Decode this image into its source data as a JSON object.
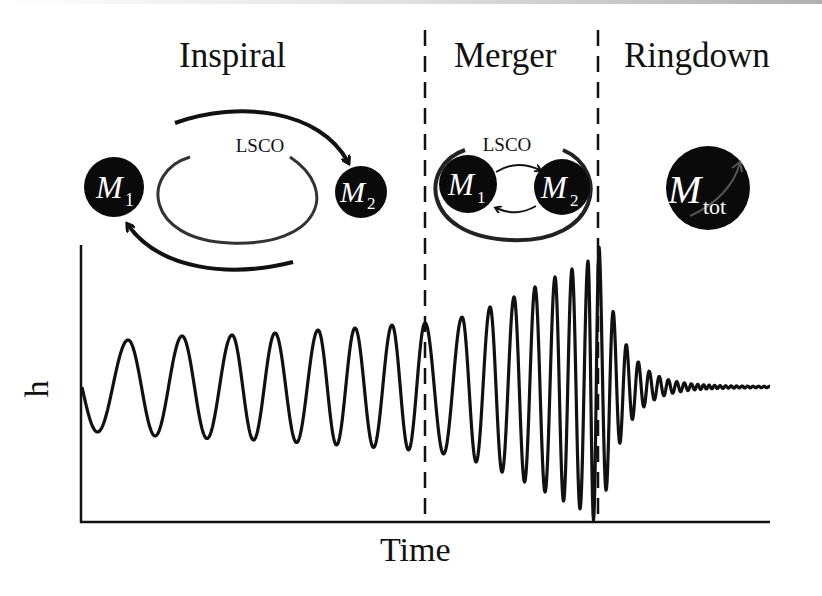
{
  "phases": [
    {
      "label": "Inspiral"
    },
    {
      "label": "Merger"
    },
    {
      "label": "Ringdown"
    }
  ],
  "orbit_label": "LSCO",
  "bodies": {
    "m1": {
      "symbol": "M",
      "subscript": "1"
    },
    "m2": {
      "symbol": "M",
      "subscript": "2"
    },
    "mtot": {
      "symbol": "M",
      "subscript": "tot"
    }
  },
  "axes": {
    "x_label": "Time",
    "y_label": "h"
  },
  "colors": {
    "ink": "#111111",
    "orbit": "#444444",
    "background": "#ffffff"
  },
  "chart_data": {
    "type": "line",
    "title": "",
    "xlabel": "Time",
    "ylabel": "h",
    "regions": [
      {
        "name": "Inspiral",
        "x_start": 0.0,
        "x_end": 0.5
      },
      {
        "name": "Merger",
        "x_start": 0.5,
        "x_end": 0.75
      },
      {
        "name": "Ringdown",
        "x_start": 0.75,
        "x_end": 1.0
      }
    ],
    "dividers_x": [
      0.5,
      0.75
    ],
    "grid": false,
    "ticks": "none"
  }
}
